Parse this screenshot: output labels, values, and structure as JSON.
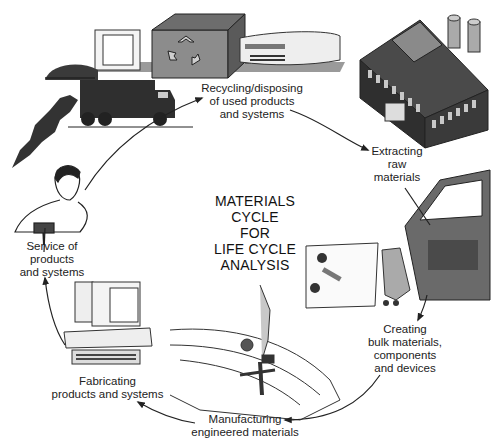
{
  "diagram": {
    "title_lines": [
      "MATERIALS",
      "CYCLE",
      "FOR",
      "LIFE CYCLE",
      "ANALYSIS"
    ],
    "stages": [
      {
        "id": "recycling",
        "lines": [
          "Recycling/disposing",
          "of used products",
          "and systems"
        ],
        "illustration": "recycling-machine-and-garbage-truck"
      },
      {
        "id": "extracting",
        "lines": [
          "Extracting",
          "raw",
          "materials"
        ],
        "illustration": "factory-building"
      },
      {
        "id": "creating",
        "lines": [
          "Creating",
          "bulk materials,",
          "components",
          "and devices"
        ],
        "illustration": "car-door-components"
      },
      {
        "id": "manufacturing",
        "lines": [
          "Manufacturing",
          "engineered materials"
        ],
        "illustration": "engine-part-assembly"
      },
      {
        "id": "fabricating",
        "lines": [
          "Fabricating",
          "products and systems"
        ],
        "illustration": "desktop-computer"
      },
      {
        "id": "service",
        "lines": [
          "Service of",
          "products",
          "and systems"
        ],
        "illustration": "technician-repairing"
      }
    ],
    "flow": [
      "recycling",
      "extracting",
      "creating",
      "manufacturing",
      "fabricating",
      "service",
      "recycling"
    ],
    "colors": {
      "ink": "#222222",
      "dark_fill": "#3a3a3a",
      "mid_fill": "#7a7a7a",
      "light_fill": "#bdbdbd",
      "background": "#ffffff"
    }
  }
}
